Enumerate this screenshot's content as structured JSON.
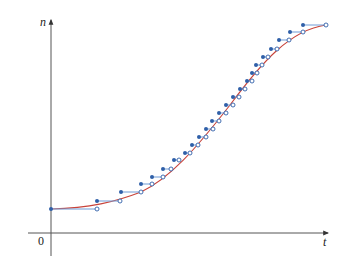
{
  "chart_data": {
    "type": "line",
    "title": "",
    "xlabel": "t",
    "ylabel": "n",
    "origin_label": "0",
    "grid": false,
    "legend": null,
    "colors": {
      "curve": "#c8433a",
      "step_line": "#6e9bd6",
      "dot": "#2f5fa8",
      "axis": "#555555"
    },
    "axes": {
      "origin_px": [
        51,
        233
      ],
      "x_end_px": 328,
      "y_top_px": 20
    },
    "steps": [
      {
        "x0": 51,
        "x1": 97,
        "y": 209
      },
      {
        "x0": 97,
        "x1": 120,
        "y": 201
      },
      {
        "x0": 121,
        "x1": 141,
        "y": 192
      },
      {
        "x0": 141,
        "x1": 152,
        "y": 184
      },
      {
        "x0": 152,
        "x1": 163,
        "y": 177
      },
      {
        "x0": 163,
        "x1": 171,
        "y": 169
      },
      {
        "x0": 174,
        "x1": 179,
        "y": 160
      },
      {
        "x0": 185,
        "x1": 190,
        "y": 153
      },
      {
        "x0": 192,
        "x1": 198,
        "y": 145
      },
      {
        "x0": 199,
        "x1": 206,
        "y": 137
      },
      {
        "x0": 206,
        "x1": 213,
        "y": 129
      },
      {
        "x0": 212,
        "x1": 219,
        "y": 121
      },
      {
        "x0": 219,
        "x1": 226,
        "y": 113
      },
      {
        "x0": 226,
        "x1": 233,
        "y": 105
      },
      {
        "x0": 233,
        "x1": 239,
        "y": 97
      },
      {
        "x0": 240,
        "x1": 245,
        "y": 89
      },
      {
        "x0": 247,
        "x1": 252,
        "y": 81
      },
      {
        "x0": 252,
        "x1": 257,
        "y": 73
      },
      {
        "x0": 256,
        "x1": 262,
        "y": 65
      },
      {
        "x0": 263,
        "x1": 268,
        "y": 57
      },
      {
        "x0": 271,
        "x1": 277,
        "y": 49
      },
      {
        "x0": 279,
        "x1": 289,
        "y": 40
      },
      {
        "x0": 290,
        "x1": 303,
        "y": 32
      },
      {
        "x0": 303,
        "x1": 326,
        "y": 25
      }
    ],
    "curve_path": "M51,209 C90,208 115,202 141,192 C170,178 195,150 230,105 C262,62 290,30 326,25"
  }
}
